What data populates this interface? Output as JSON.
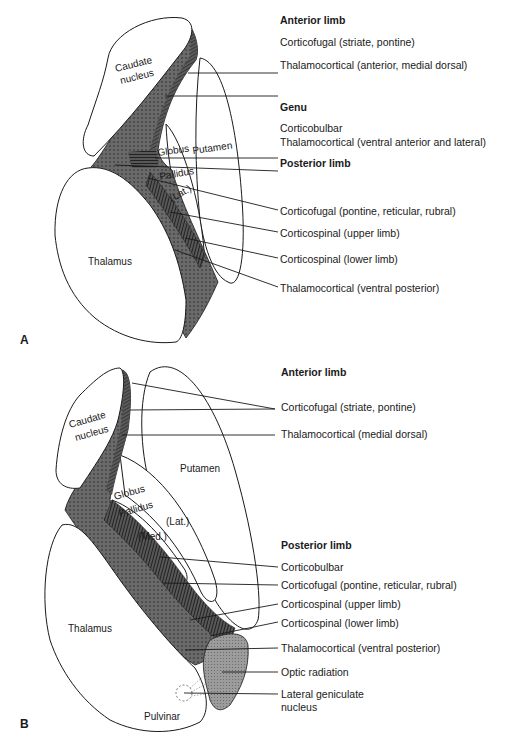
{
  "figure": {
    "panels": [
      {
        "letter": "A",
        "structures": {
          "caudate_1": "Caudate",
          "caudate_2": "nucleus",
          "globus": "Globus",
          "pallidus": "Pallidus",
          "putamen": "Putamen",
          "lat": "(Lat.)",
          "thalamus": "Thalamus"
        },
        "sections": [
          {
            "heading": "Anterior limb",
            "labels": [
              "Corticofugal (striate, pontine)",
              "Thalamocortical (anterior, medial dorsal)"
            ]
          },
          {
            "heading": "Genu",
            "labels": [
              "Corticobulbar",
              "Thalamocortical (ventral anterior and lateral)"
            ]
          },
          {
            "heading": "Posterior limb",
            "labels": [
              "Corticofugal (pontine, reticular, rubral)",
              "Corticospinal (upper limb)",
              "Corticospinal (lower limb)",
              "Thalamocortical (ventral posterior)"
            ]
          }
        ]
      },
      {
        "letter": "B",
        "structures": {
          "caudate_1": "Caudate",
          "caudate_2": "nucleus",
          "globus": "Globus",
          "pallidus": "Pallidus",
          "putamen": "Putamen",
          "lat": "(Lat.)",
          "med": "(Med.)",
          "thalamus": "Thalamus",
          "pulvinar": "Pulvinar"
        },
        "sections": [
          {
            "heading": "Anterior limb",
            "labels": [
              "Corticofugal (striate, pontine)",
              "Thalamocortical (medial dorsal)"
            ]
          },
          {
            "heading": "Posterior limb",
            "labels": [
              "Corticobulbar",
              "Corticofugal (pontine, reticular, rubral)",
              "Corticospinal (upper limb)",
              "Corticospinal (lower limb)",
              "Thalamocortical (ventral posterior)",
              "Optic radiation",
              "Lateral geniculate",
              "nucleus"
            ]
          }
        ]
      }
    ],
    "colors": {
      "stroke": "#1a1a1a",
      "fill_dark": "#4a4a4a",
      "fill_dotted": "#6e6e6e",
      "fill_light": "#9a9a9a",
      "background": "#ffffff"
    }
  }
}
